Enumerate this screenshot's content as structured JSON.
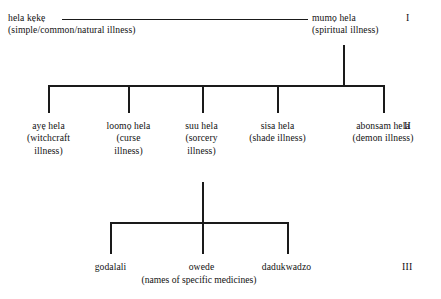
{
  "diagram": {
    "type": "taxonomy-tree",
    "title": "",
    "levels": [
      {
        "numeral": "I",
        "nodes": [
          {
            "term": "hela kẹkẹ",
            "gloss": "(simple/common/natural illness)"
          },
          {
            "term": "mumọ hela",
            "gloss": "(spiritual illness)"
          }
        ]
      },
      {
        "numeral": "II",
        "nodes": [
          {
            "term": "ayẹ hela",
            "gloss": "(witchcraft illness)"
          },
          {
            "term": "loomọ hela",
            "gloss": "(curse illness)"
          },
          {
            "term": "suu hela",
            "gloss": "(sorcery illness)"
          },
          {
            "term": "sisa hela",
            "gloss": "(shade illness)"
          },
          {
            "term": "abonsam hela",
            "gloss": "(demon illness)"
          }
        ]
      },
      {
        "numeral": "III",
        "nodes": [
          {
            "term": "godalali",
            "gloss": ""
          },
          {
            "term": "owede",
            "gloss": ""
          },
          {
            "term": "dadukwadzo",
            "gloss": ""
          }
        ],
        "caption": "(names of specific medicines)"
      }
    ]
  },
  "level_one": {
    "left": {
      "term": "hela kẹkẹ",
      "gloss": "(simple/common/natural illness)"
    },
    "right": {
      "term": "mumọ hela",
      "gloss": "(spiritual illness)"
    },
    "numeral": "I"
  },
  "level_two": {
    "numeral": "II",
    "items": [
      {
        "term": "ayẹ hela",
        "gloss_line1": "(witchcraft",
        "gloss_line2": "illness)"
      },
      {
        "term": "loomọ hela",
        "gloss_line1": "(curse",
        "gloss_line2": "illness)"
      },
      {
        "term": "suu hela",
        "gloss_line1": "(sorcery",
        "gloss_line2": "illness)"
      },
      {
        "term": "sisa hela",
        "gloss_line1": "(shade illness)",
        "gloss_line2": ""
      },
      {
        "term": "abonsam hela",
        "gloss_line1": "(demon illness)",
        "gloss_line2": ""
      }
    ]
  },
  "level_three": {
    "numeral": "III",
    "items": [
      {
        "term": "godalali"
      },
      {
        "term": "owede"
      },
      {
        "term": "dadukwadzo"
      }
    ],
    "caption": "(names of specific medicines)"
  },
  "colors": {
    "ink": "#111111",
    "rule": "#1a1a1a",
    "background": "#ffffff"
  }
}
